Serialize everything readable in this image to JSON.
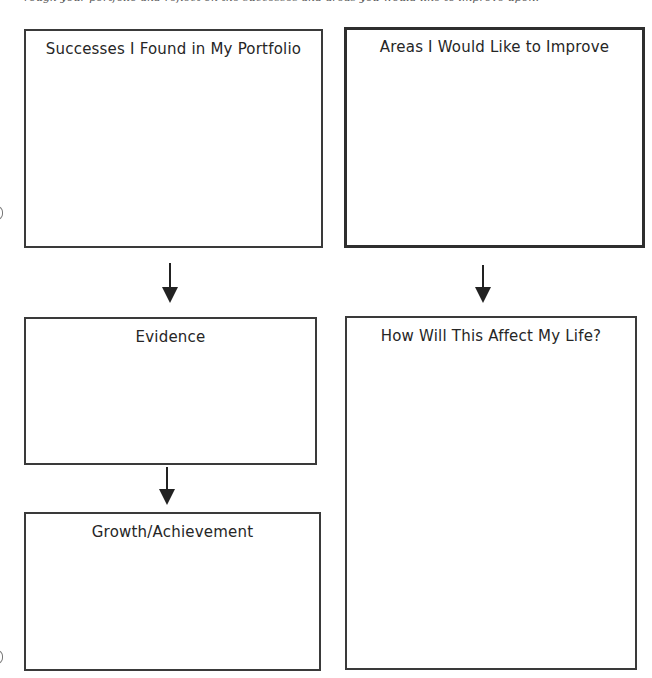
{
  "page": {
    "top_fragment_text": "rough your portfolio and reflect on the successes and areas you would like to improve upon."
  },
  "boxes": {
    "successes": {
      "title": "Successes I Found in My Portfolio",
      "content": ""
    },
    "areas_to_improve": {
      "title": "Areas I Would Like to Improve",
      "content": ""
    },
    "evidence": {
      "title": "Evidence",
      "content": ""
    },
    "growth_achievement": {
      "title": "Growth/Achievement",
      "content": ""
    },
    "life_effect": {
      "title": "How Will This Affect My Life?",
      "content": ""
    }
  },
  "arrows": [
    {
      "from": "successes",
      "to": "evidence",
      "direction": "down"
    },
    {
      "from": "areas_to_improve",
      "to": "life_effect",
      "direction": "down"
    },
    {
      "from": "evidence",
      "to": "growth_achievement",
      "direction": "down"
    }
  ],
  "colors": {
    "border": "#3a3a3a",
    "text": "#262626",
    "arrow": "#222222",
    "background": "#ffffff"
  }
}
